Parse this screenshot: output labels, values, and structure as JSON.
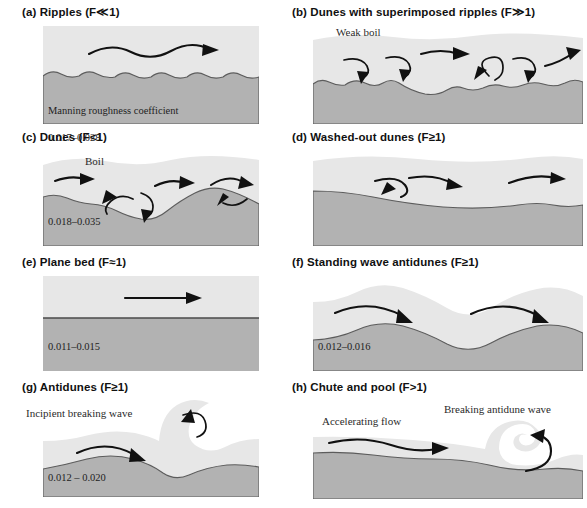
{
  "figure": {
    "manning_legend": "Manning roughness coefficient",
    "colors": {
      "water": "#e7e7e7",
      "bed": "#b2b2b2",
      "bed_line": "#5c5c5c",
      "arrow": "#111111",
      "background": "#ffffff",
      "text": "#1a1a1a"
    }
  },
  "panels": [
    {
      "id": "a",
      "label": "(a)",
      "name": "Ripples",
      "froude": "(F≪1)",
      "caption": "(a) Ripples (F≪1)",
      "manning_label": "Manning roughness coefficient",
      "manning_value": "0.017–0.028",
      "annotations": []
    },
    {
      "id": "b",
      "label": "(b)",
      "name": "Dunes with superimposed ripples",
      "froude": "(F≫1)",
      "caption": "(b) Dunes with superimposed ripples (F≫1)",
      "manning_label": "",
      "manning_value": "",
      "annotations": [
        "Weak boil"
      ]
    },
    {
      "id": "c",
      "label": "(c)",
      "name": "Dunes",
      "froude": "(F<1)",
      "caption": "(c) Dunes (F<1)",
      "manning_label": "",
      "manning_value": "0.018–0.035",
      "annotations": [
        "Boil"
      ]
    },
    {
      "id": "d",
      "label": "(d)",
      "name": "Washed-out dunes",
      "froude": "(F≥1)",
      "caption": "(d) Washed-out dunes (F≥1)",
      "manning_label": "",
      "manning_value": "",
      "annotations": []
    },
    {
      "id": "e",
      "label": "(e)",
      "name": "Plane bed",
      "froude": "(F≈1)",
      "caption": "(e) Plane bed (F≈1)",
      "manning_label": "",
      "manning_value": "0.011–0.015",
      "annotations": []
    },
    {
      "id": "f",
      "label": "(f)",
      "name": "Standing wave antidunes",
      "froude": "(F≥1)",
      "caption": "(f) Standing wave antidunes (F≥1)",
      "manning_label": "",
      "manning_value": "0.012–0.016",
      "annotations": []
    },
    {
      "id": "g",
      "label": "(g)",
      "name": "Antidunes",
      "froude": "(F≥1)",
      "caption": "(g) Antidunes (F≥1)",
      "manning_label": "",
      "manning_value": "0.012 – 0.020",
      "annotations": [
        "Incipient breaking wave"
      ]
    },
    {
      "id": "h",
      "label": "(h)",
      "name": "Chute and pool",
      "froude": "(F>1)",
      "caption": "(h) Chute and pool (F>1)",
      "manning_label": "",
      "manning_value": "",
      "annotations": [
        "Accelerating flow",
        "Breaking antidune wave"
      ]
    }
  ],
  "annotation_text": {
    "weak_boil": "Weak boil",
    "boil": "Boil",
    "incipient_breaking_wave": "Incipient breaking wave",
    "accelerating_flow": "Accelerating flow",
    "breaking_antidune_wave": "Breaking antidune wave"
  }
}
